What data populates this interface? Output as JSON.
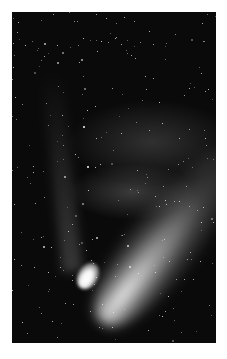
{
  "image": {
    "subject": "comet with bright nucleus and diffuse tail against star field",
    "background_color": "#0a0a0a",
    "frame_color": "#ffffff",
    "tail_direction": "upper-right",
    "nucleus_position": "lower-left"
  }
}
